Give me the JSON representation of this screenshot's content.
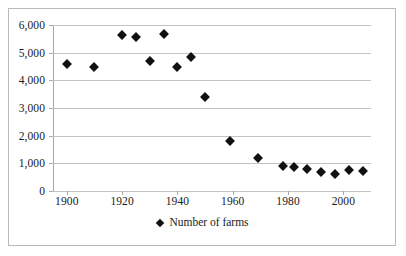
{
  "chart_data": {
    "type": "scatter",
    "title": "",
    "xlabel": "",
    "ylabel": "",
    "xlim": [
      1895,
      2010
    ],
    "ylim": [
      0,
      6000
    ],
    "grid": true,
    "legend_position": "bottom",
    "series": [
      {
        "name": "Number of farms",
        "marker": "diamond",
        "color": "#111111",
        "points": [
          {
            "x": 1900,
            "y": 4600
          },
          {
            "x": 1910,
            "y": 4500
          },
          {
            "x": 1920,
            "y": 5650
          },
          {
            "x": 1925,
            "y": 5550
          },
          {
            "x": 1930,
            "y": 4700
          },
          {
            "x": 1935,
            "y": 5670
          },
          {
            "x": 1940,
            "y": 4500
          },
          {
            "x": 1945,
            "y": 4850
          },
          {
            "x": 1950,
            "y": 3400
          },
          {
            "x": 1959,
            "y": 1790
          },
          {
            "x": 1969,
            "y": 1180
          },
          {
            "x": 1978,
            "y": 900
          },
          {
            "x": 1982,
            "y": 870
          },
          {
            "x": 1987,
            "y": 810
          },
          {
            "x": 1992,
            "y": 670
          },
          {
            "x": 1997,
            "y": 630
          },
          {
            "x": 2002,
            "y": 770
          },
          {
            "x": 2007,
            "y": 720
          }
        ]
      }
    ],
    "y_ticks": [
      {
        "value": 0,
        "label": "0"
      },
      {
        "value": 1000,
        "label": "1,000"
      },
      {
        "value": 2000,
        "label": "2,000"
      },
      {
        "value": 3000,
        "label": "3,000"
      },
      {
        "value": 4000,
        "label": "4,000"
      },
      {
        "value": 5000,
        "label": "5,000"
      },
      {
        "value": 6000,
        "label": "6,000"
      }
    ],
    "x_ticks": [
      {
        "value": 1900,
        "label": "1900"
      },
      {
        "value": 1920,
        "label": "1920"
      },
      {
        "value": 1940,
        "label": "1940"
      },
      {
        "value": 1960,
        "label": "1960"
      },
      {
        "value": 1980,
        "label": "1980"
      },
      {
        "value": 2000,
        "label": "2000"
      }
    ]
  },
  "legend": {
    "entries": [
      {
        "label": "Number of farms",
        "marker": "diamond",
        "color": "#111111"
      }
    ]
  },
  "colors": {
    "marker": "#111111",
    "gridline": "#c4c4c4",
    "axis": "#a8a8a8",
    "border": "#b9b9b9",
    "text": "#1a1a1a",
    "background": "#ffffff"
  }
}
